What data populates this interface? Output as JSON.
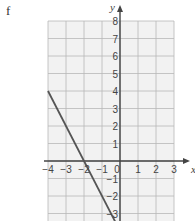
{
  "part_label": "f",
  "chart_data": {
    "type": "line",
    "title": "",
    "xlabel": "x",
    "ylabel": "y",
    "xlim": [
      -4,
      3
    ],
    "ylim": [
      -3,
      8
    ],
    "x_ticks": [
      "-4",
      "-3",
      "-2",
      "-1",
      "0",
      "1",
      "2",
      "3"
    ],
    "y_ticks": [
      "8",
      "7",
      "6",
      "5",
      "4",
      "3",
      "2",
      "1",
      "-1",
      "-2",
      "-3"
    ],
    "grid": true,
    "series": [
      {
        "name": "line",
        "equation": "y = -2x - 4",
        "points": [
          [
            -4,
            4
          ],
          [
            0,
            -4
          ]
        ]
      }
    ]
  },
  "colors": {
    "grid": "#b8b8b8",
    "grid_bg": "#f2f2f2",
    "axis": "#444444",
    "line": "#555555"
  }
}
